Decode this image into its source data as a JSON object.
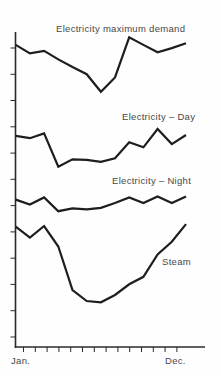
{
  "figure": {
    "background": "#fefefe",
    "line_color": "#1e1e1e",
    "axis_color": "#2a2a2a",
    "text_color": "#474747"
  },
  "chart_data": {
    "type": "line",
    "title": "",
    "xlabel": "",
    "ylabel": "",
    "grid": false,
    "legend_position": "inline label above each line",
    "x_axis": {
      "start_label": "Jan.",
      "end_label": "Dec.",
      "tick_count": 14,
      "note": "months from January to December, 13 evenly spaced points per series"
    },
    "y_axis": {
      "tick_count": 12,
      "tick_labels": "none printed",
      "units": "relative level, percent of axis height (no numeric scale shown)"
    },
    "series": [
      {
        "name": "Electricity maximum demand",
        "values": [
          95.9,
          93.2,
          94.0,
          91.3,
          88.9,
          86.6,
          81.0,
          85.6,
          98.3,
          95.9,
          93.6,
          94.9,
          96.4
        ]
      },
      {
        "name": "Electricity – Day",
        "values": [
          67.0,
          66.3,
          67.8,
          57.2,
          59.6,
          59.4,
          58.8,
          59.9,
          65.0,
          63.4,
          69.2,
          64.4,
          67.3
        ]
      },
      {
        "name": "Electricity – Night",
        "values": [
          46.8,
          45.2,
          47.5,
          43.1,
          44.0,
          43.7,
          44.2,
          45.7,
          47.5,
          45.7,
          47.8,
          45.7,
          47.8
        ]
      },
      {
        "name": "Steam",
        "values": [
          38.2,
          34.7,
          38.4,
          31.9,
          18.1,
          14.6,
          14.2,
          16.5,
          19.9,
          22.3,
          29.4,
          33.4,
          39.0
        ]
      }
    ]
  }
}
